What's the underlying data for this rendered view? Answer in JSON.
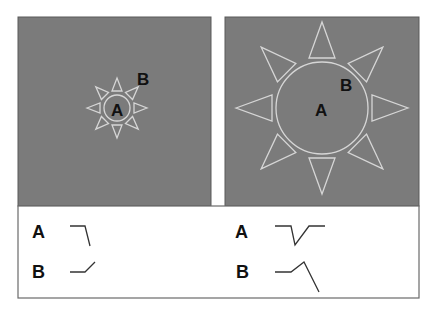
{
  "colors": {
    "panel_gray": "#7b7b7b",
    "sun_outline": "#d6d6d6",
    "label": "#111111",
    "background": "#ffffff"
  },
  "left_panel": {
    "sun_size": "small",
    "center_label": "A",
    "outer_label": "B"
  },
  "right_panel": {
    "sun_size": "large",
    "center_label": "A",
    "outer_label": "B"
  },
  "legend": {
    "left": {
      "rows": [
        {
          "label": "A",
          "curve": "flat-then-drop"
        },
        {
          "label": "B",
          "curve": "flat-then-rise"
        }
      ]
    },
    "right": {
      "rows": [
        {
          "label": "A",
          "curve": "flat-dip-recover"
        },
        {
          "label": "B",
          "curve": "flat-rise-then-drop"
        }
      ]
    }
  }
}
